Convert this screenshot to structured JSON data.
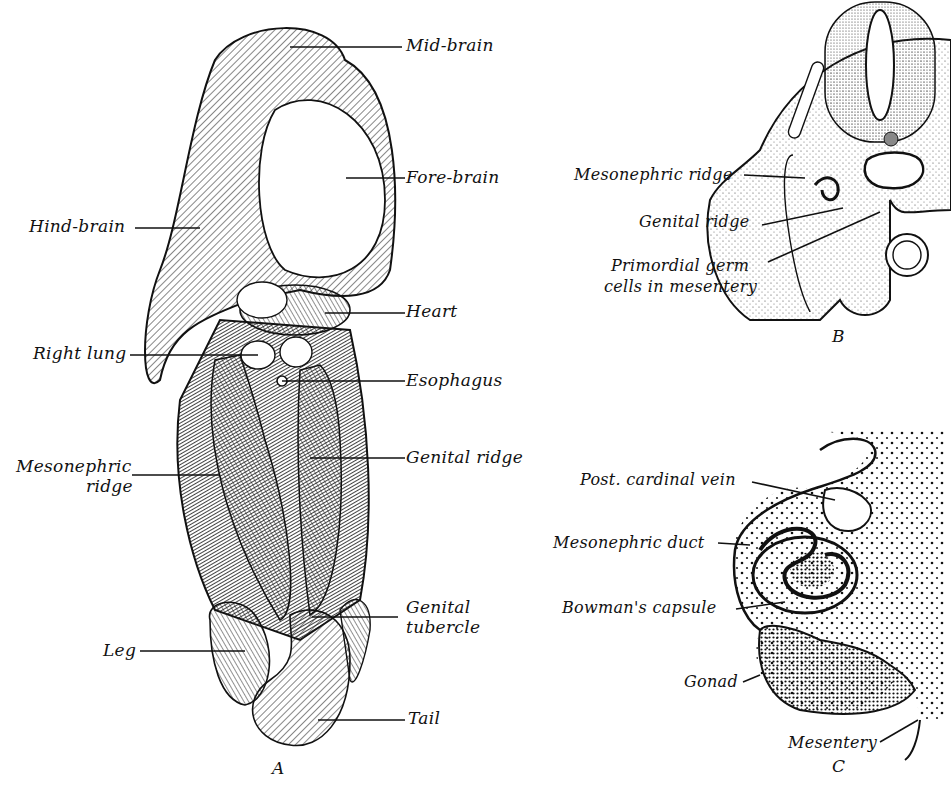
{
  "figure": {
    "panels": [
      {
        "id": "A",
        "letter": "A",
        "description": "Ventral view of human embryo showing developing organs",
        "labels": [
          {
            "text": "Mid-brain"
          },
          {
            "text": "Fore-brain"
          },
          {
            "text": "Hind-brain"
          },
          {
            "text": "Heart"
          },
          {
            "text": "Right lung"
          },
          {
            "text": "Esophagus"
          },
          {
            "text": "Mesonephric",
            "line2": "ridge"
          },
          {
            "text": "Genital ridge"
          },
          {
            "text": "Genital",
            "line2": "tubercle"
          },
          {
            "text": "Leg"
          },
          {
            "text": "Tail"
          }
        ]
      },
      {
        "id": "B",
        "letter": "B",
        "description": "Transverse section through embryo",
        "labels": [
          {
            "text": "Mesonephric ridge"
          },
          {
            "text": "Genital ridge"
          },
          {
            "text": "Primordial germ",
            "line2": "cells in mesentery"
          }
        ]
      },
      {
        "id": "C",
        "letter": "C",
        "description": "Detail section of mesonephros and gonad",
        "labels": [
          {
            "text": "Post. cardinal vein"
          },
          {
            "text": "Mesonephric duct"
          },
          {
            "text": "Bowman's capsule"
          },
          {
            "text": "Gonad"
          },
          {
            "text": "Mesentery"
          }
        ]
      }
    ]
  }
}
